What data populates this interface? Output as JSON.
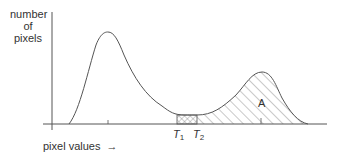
{
  "diagram": {
    "type": "histogram-threshold",
    "y_axis_label": [
      "number",
      "of",
      "pixels"
    ],
    "x_axis_label": "pixel values",
    "x_axis_arrow": "→",
    "thresholds": [
      {
        "label": "T",
        "subscript": "1"
      },
      {
        "label": "T",
        "subscript": "2"
      }
    ],
    "region_label": "A",
    "colors": {
      "line": "#555555",
      "text": "#333333",
      "hatch": "#777777",
      "background": "#ffffff"
    }
  }
}
